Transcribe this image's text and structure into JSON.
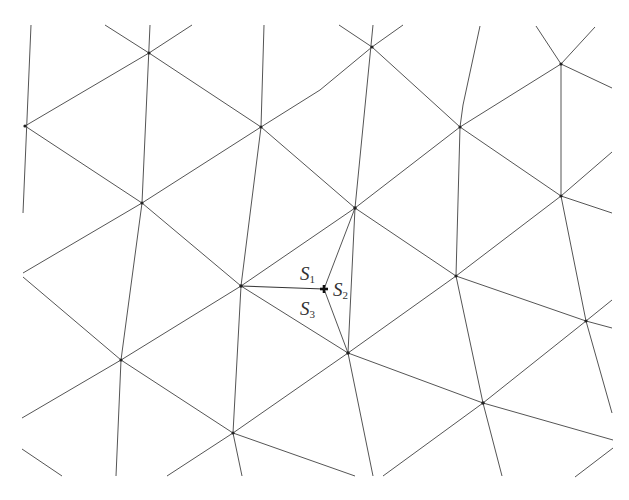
{
  "diagram": {
    "type": "triangular-mesh",
    "line_color": "#555555",
    "vertices": [
      {
        "id": "v1",
        "x": 149,
        "y": 53
      },
      {
        "id": "v2",
        "x": 25,
        "y": 126
      },
      {
        "id": "v3",
        "x": 261,
        "y": 127
      },
      {
        "id": "v4",
        "x": 142,
        "y": 203
      },
      {
        "id": "v5",
        "x": 372,
        "y": 47
      },
      {
        "id": "v6",
        "x": 460,
        "y": 127
      },
      {
        "id": "v7",
        "x": 561,
        "y": 64
      },
      {
        "id": "v8",
        "x": 561,
        "y": 196
      },
      {
        "id": "v9",
        "x": 355,
        "y": 208
      },
      {
        "id": "v10",
        "x": 241,
        "y": 286
      },
      {
        "id": "v11",
        "x": 121,
        "y": 360
      },
      {
        "id": "v12",
        "x": 233,
        "y": 433
      },
      {
        "id": "v13",
        "x": 456,
        "y": 276
      },
      {
        "id": "v14",
        "x": 348,
        "y": 353
      },
      {
        "id": "v15",
        "x": 483,
        "y": 403
      },
      {
        "id": "v16",
        "x": 586,
        "y": 321
      }
    ],
    "point": {
      "id": "P",
      "x": 324,
      "y": 289,
      "marker": "cross"
    },
    "labels": [
      {
        "id": "S1",
        "base": "S",
        "sub": "1",
        "x": 300,
        "y": 264
      },
      {
        "id": "S2",
        "base": "S",
        "sub": "2",
        "x": 333,
        "y": 280
      },
      {
        "id": "S3",
        "base": "S",
        "sub": "3",
        "x": 300,
        "y": 299
      }
    ]
  }
}
